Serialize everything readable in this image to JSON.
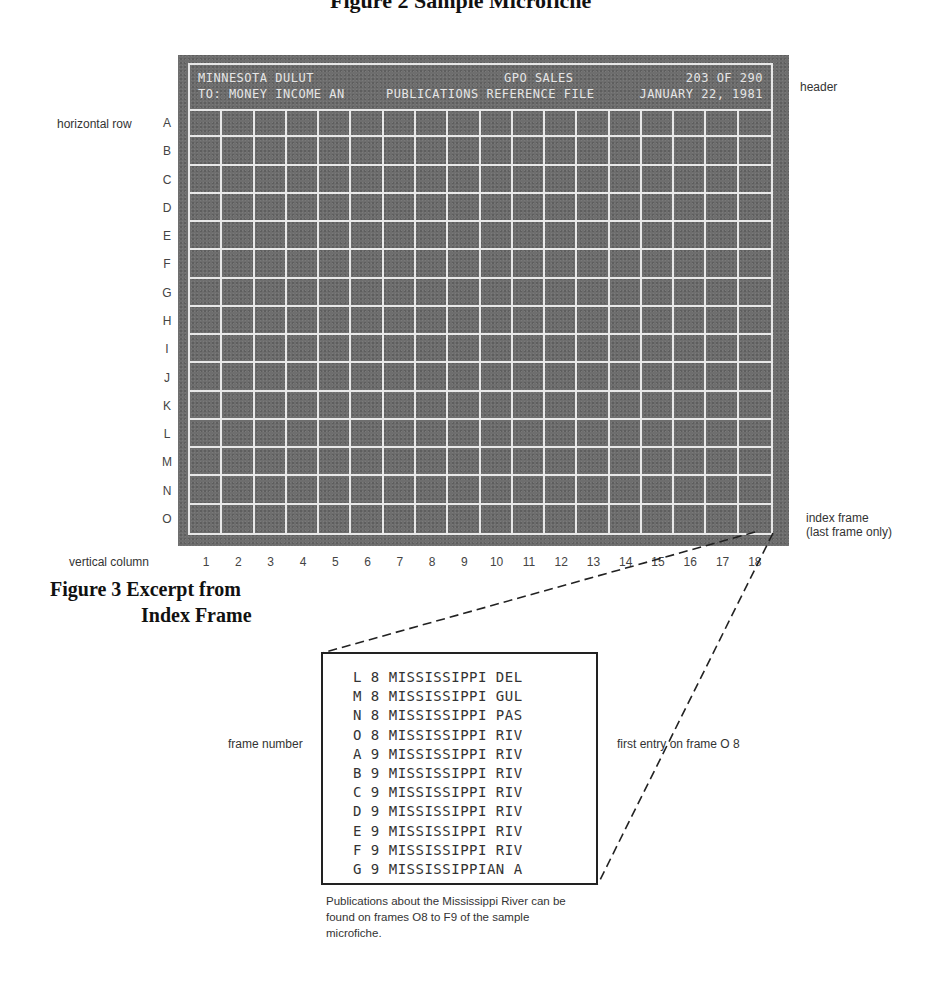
{
  "page_title_partial": "Figure 2 Sample Microfiche",
  "microfiche": {
    "header": {
      "left_line1": "MINNESOTA DULUT",
      "left_line2": "TO: MONEY INCOME AN",
      "center_line1": "GPO SALES",
      "center_line2": "PUBLICATIONS REFERENCE FILE",
      "right_line1": "203 OF 290",
      "right_line2": "JANUARY 22, 1981"
    },
    "rows": [
      "A",
      "B",
      "C",
      "D",
      "E",
      "F",
      "G",
      "H",
      "I",
      "J",
      "K",
      "L",
      "M",
      "N",
      "O"
    ],
    "columns": [
      "1",
      "2",
      "3",
      "4",
      "5",
      "6",
      "7",
      "8",
      "9",
      "10",
      "11",
      "12",
      "13",
      "14",
      "15",
      "16",
      "17",
      "18"
    ]
  },
  "labels": {
    "horizontal_row": "horizontal row",
    "vertical_column": "vertical column",
    "header": "header",
    "index_frame_line1": "index frame",
    "index_frame_line2": "(last frame only)",
    "frame_number": "frame number",
    "first_entry": "first entry on frame O 8"
  },
  "figure_caption": {
    "line1": "Figure 3 Excerpt from",
    "line2": "Index Frame"
  },
  "index_excerpt": {
    "entries": [
      "L 8 MISSISSIPPI DEL",
      "M 8 MISSISSIPPI GUL",
      "N 8 MISSISSIPPI PAS",
      "O 8 MISSISSIPPI RIV",
      "A 9 MISSISSIPPI RIV",
      "B 9 MISSISSIPPI RIV",
      "C 9 MISSISSIPPI RIV",
      "D 9 MISSISSIPPI RIV",
      "E 9 MISSISSIPPI RIV",
      "F 9 MISSISSIPPI RIV",
      "G 9 MISSISSIPPIAN A"
    ]
  },
  "note": "Publications about the Mississippi River can be found on frames O8 to F9 of the sample microfiche."
}
